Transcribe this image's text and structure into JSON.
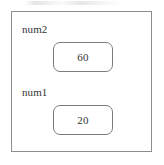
{
  "diagram": {
    "type": "memory-stack-frame",
    "title": "",
    "outer_frame": {
      "label": "",
      "border_color": "#8e8e92",
      "background": "#ffffff"
    },
    "variables": [
      {
        "name": "num2",
        "value": "60",
        "box_border_color": "#7c7c80",
        "box_background": "#ffffff",
        "text_color": "#333333"
      },
      {
        "name": "num1",
        "value": "20",
        "box_border_color": "#7c7c80",
        "box_background": "#ffffff",
        "text_color": "#333333"
      }
    ]
  }
}
